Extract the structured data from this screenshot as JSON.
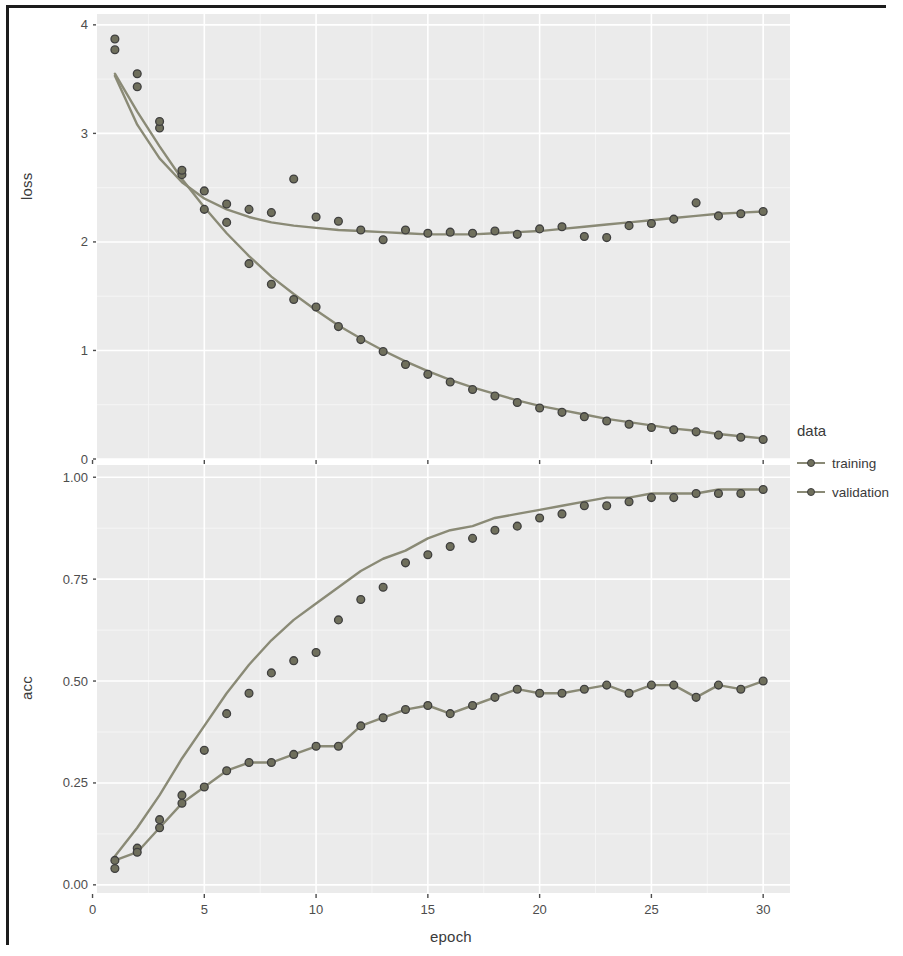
{
  "figure": {
    "xlabel": "epoch",
    "panels": [
      {
        "key": "loss",
        "ylabel": "loss"
      },
      {
        "key": "acc",
        "ylabel": "acc"
      }
    ]
  },
  "legend": {
    "title": "data",
    "entries": [
      {
        "label": "training",
        "color": "#7d7d66"
      },
      {
        "label": "validation",
        "color": "#8a8a74"
      }
    ]
  },
  "style": {
    "panel_background": "#ebebeb",
    "grid_major": "#ffffff",
    "grid_minor": "#f5f5f5",
    "point_fill": "#6f6f5c",
    "point_stroke": "#3f3f3f",
    "line_color": "#8a8a76",
    "axis_text": "#4d4d4d",
    "frame": "#1d1d1d"
  },
  "chart_data": [
    {
      "type": "scatter",
      "panel": "loss",
      "title": "",
      "xlabel": "epoch",
      "ylabel": "loss",
      "xlim": [
        0.2,
        31.2
      ],
      "ylim": [
        0.0,
        4.1
      ],
      "xticks": [
        0,
        5,
        10,
        15,
        20,
        25,
        30
      ],
      "yticks": [
        0,
        1,
        2,
        3,
        4
      ],
      "ytick_labels": [
        "0",
        "1",
        "2",
        "3",
        "4"
      ],
      "grid": true,
      "legend_position": "right",
      "x": [
        1,
        2,
        3,
        4,
        5,
        6,
        7,
        8,
        9,
        10,
        11,
        12,
        13,
        14,
        15,
        16,
        17,
        18,
        19,
        20,
        21,
        22,
        23,
        24,
        25,
        26,
        27,
        28,
        29,
        30
      ],
      "series": [
        {
          "name": "training",
          "has_smooth": true,
          "values": [
            3.77,
            3.43,
            3.05,
            2.62,
            2.3,
            2.18,
            1.8,
            1.61,
            1.47,
            1.4,
            1.22,
            1.1,
            0.99,
            0.87,
            0.78,
            0.71,
            0.64,
            0.58,
            0.52,
            0.47,
            0.43,
            0.39,
            0.35,
            0.32,
            0.29,
            0.27,
            0.25,
            0.22,
            0.2,
            0.18
          ],
          "smooth": [
            3.55,
            3.2,
            2.88,
            2.58,
            2.32,
            2.08,
            1.87,
            1.68,
            1.52,
            1.37,
            1.23,
            1.11,
            1.0,
            0.9,
            0.81,
            0.73,
            0.66,
            0.6,
            0.54,
            0.49,
            0.45,
            0.41,
            0.37,
            0.34,
            0.31,
            0.28,
            0.26,
            0.23,
            0.21,
            0.19
          ]
        },
        {
          "name": "validation",
          "has_smooth": true,
          "values": [
            3.87,
            3.55,
            3.11,
            2.66,
            2.47,
            2.35,
            2.3,
            2.27,
            2.58,
            2.23,
            2.19,
            2.11,
            2.02,
            2.11,
            2.08,
            2.09,
            2.08,
            2.1,
            2.07,
            2.12,
            2.14,
            2.05,
            2.04,
            2.15,
            2.17,
            2.21,
            2.36,
            2.24,
            2.26,
            2.28
          ],
          "smooth": [
            3.53,
            3.08,
            2.77,
            2.55,
            2.4,
            2.3,
            2.23,
            2.18,
            2.15,
            2.13,
            2.11,
            2.1,
            2.09,
            2.08,
            2.07,
            2.07,
            2.07,
            2.08,
            2.09,
            2.1,
            2.12,
            2.14,
            2.16,
            2.18,
            2.2,
            2.22,
            2.24,
            2.26,
            2.27,
            2.28
          ]
        }
      ]
    },
    {
      "type": "scatter",
      "panel": "acc",
      "title": "",
      "xlabel": "epoch",
      "ylabel": "acc",
      "xlim": [
        0.2,
        31.2
      ],
      "ylim": [
        -0.02,
        1.03
      ],
      "xticks": [
        0,
        5,
        10,
        15,
        20,
        25,
        30
      ],
      "yticks": [
        0.0,
        0.25,
        0.5,
        0.75,
        1.0
      ],
      "ytick_labels": [
        "0.00",
        "0.25",
        "0.50",
        "0.75",
        "1.00"
      ],
      "grid": true,
      "legend_position": "right",
      "x": [
        1,
        2,
        3,
        4,
        5,
        6,
        7,
        8,
        9,
        10,
        11,
        12,
        13,
        14,
        15,
        16,
        17,
        18,
        19,
        20,
        21,
        22,
        23,
        24,
        25,
        26,
        27,
        28,
        29,
        30
      ],
      "series": [
        {
          "name": "training",
          "has_smooth": true,
          "values": [
            0.04,
            0.09,
            0.16,
            0.22,
            0.33,
            0.42,
            0.47,
            0.52,
            0.55,
            0.57,
            0.65,
            0.7,
            0.73,
            0.79,
            0.81,
            0.83,
            0.85,
            0.87,
            0.88,
            0.9,
            0.91,
            0.93,
            0.93,
            0.94,
            0.95,
            0.95,
            0.96,
            0.96,
            0.96,
            0.97
          ],
          "smooth": [
            0.07,
            0.14,
            0.22,
            0.31,
            0.39,
            0.47,
            0.54,
            0.6,
            0.65,
            0.69,
            0.73,
            0.77,
            0.8,
            0.82,
            0.85,
            0.87,
            0.88,
            0.9,
            0.91,
            0.92,
            0.93,
            0.94,
            0.95,
            0.95,
            0.96,
            0.96,
            0.96,
            0.97,
            0.97,
            0.97
          ]
        },
        {
          "name": "validation",
          "has_smooth": true,
          "values": [
            0.06,
            0.08,
            0.14,
            0.2,
            0.24,
            0.28,
            0.3,
            0.3,
            0.32,
            0.34,
            0.34,
            0.39,
            0.41,
            0.43,
            0.44,
            0.42,
            0.44,
            0.46,
            0.48,
            0.47,
            0.47,
            0.48,
            0.49,
            0.47,
            0.49,
            0.49,
            0.46,
            0.49,
            0.48,
            0.5
          ]
        }
      ]
    }
  ]
}
